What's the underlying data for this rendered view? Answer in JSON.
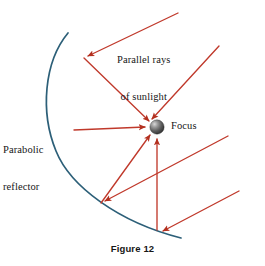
{
  "figure": {
    "caption": "Figure 12",
    "labels": {
      "sunlight_line1": "Parallel rays",
      "sunlight_line2": "of sunlight",
      "reflector_line1": "Parabolic",
      "reflector_line2": "reflector",
      "focus": "Focus"
    },
    "colors": {
      "ray": "#c0392b",
      "ray_dark": "#b3301f",
      "reflector_curve": "#2c5f78",
      "focus_sphere_dark": "#3a3a3a",
      "focus_sphere_light": "#c9c9c9",
      "text": "#161616",
      "background": "#ffffff"
    },
    "geometry": {
      "focus": {
        "x": 157,
        "y": 127,
        "r": 7
      },
      "reflector_curve": {
        "type": "parabola-arc-opening-right",
        "start": {
          "x": 68,
          "y": 33
        },
        "vertex": {
          "x": 56,
          "y": 130
        },
        "end": {
          "x": 181,
          "y": 238
        }
      },
      "incoming_rays": [
        {
          "name": "ray-top-1",
          "from": {
            "x": 178,
            "y": 13
          },
          "to": {
            "x": 84,
            "y": 58
          }
        },
        {
          "name": "ray-top-2",
          "from": {
            "x": 218,
            "y": 45
          },
          "to": {
            "x": 148,
            "y": 122
          }
        },
        {
          "name": "ray-top-3",
          "from": {
            "x": 74,
            "y": 131
          },
          "to": {
            "x": 148,
            "y": 127
          }
        },
        {
          "name": "ray-bottom-1",
          "from": {
            "x": 228,
            "y": 135
          },
          "to": {
            "x": 101,
            "y": 203
          }
        },
        {
          "name": "ray-bottom-2",
          "from": {
            "x": 238,
            "y": 190
          },
          "to": {
            "x": 160,
            "y": 232
          }
        }
      ],
      "reflected_rays": [
        {
          "name": "reflected-from-upper",
          "from": {
            "x": 84,
            "y": 58
          },
          "to": {
            "x": 150,
            "y": 122
          }
        },
        {
          "name": "reflected-from-lower",
          "from": {
            "x": 101,
            "y": 203
          },
          "to": {
            "x": 150,
            "y": 134
          }
        },
        {
          "name": "reflected-vertical",
          "from": {
            "x": 157,
            "y": 230
          },
          "to": {
            "x": 157,
            "y": 138
          }
        }
      ]
    }
  }
}
